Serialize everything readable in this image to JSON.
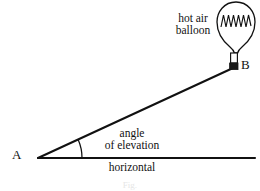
{
  "figure": {
    "title_caption": "Fig.",
    "background_color": "#ffffff",
    "ink_color": "#111111",
    "labels": {
      "balloon_line1": "hot air",
      "balloon_line2": "balloon",
      "point_b": "B",
      "point_a": "A",
      "angle_line1": "angle",
      "angle_line2": "of elevation",
      "horizontal": "horizontal"
    },
    "geometry": {
      "vertex_a_x": 38,
      "vertex_a_y": 158,
      "point_b_x": 233,
      "point_b_y": 68,
      "horizontal_end_x": 255,
      "horizontal_end_y": 158,
      "arc_radius": 44,
      "balloon_center_x": 236,
      "balloon_center_y": 25,
      "zigzag_peaks": 5
    }
  }
}
